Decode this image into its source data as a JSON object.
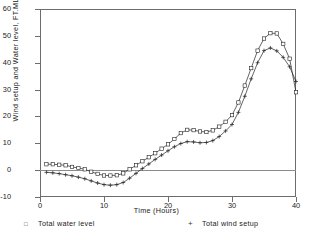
{
  "chart_data": {
    "type": "line",
    "title": "",
    "xlabel": "Time (Hours)",
    "ylabel": "Wind setup and Water level, FT.MLW",
    "xlim": [
      0,
      40
    ],
    "ylim": [
      -10,
      60
    ],
    "xticks": [
      0,
      10,
      20,
      30,
      40
    ],
    "yticks": [
      -10,
      0,
      10,
      20,
      30,
      40,
      50,
      60
    ],
    "grid": false,
    "zero_reference_line": 0,
    "legend_position": "below-axes",
    "x": [
      1,
      2,
      3,
      4,
      5,
      6,
      7,
      8,
      9,
      10,
      11,
      12,
      13,
      14,
      15,
      16,
      17,
      18,
      19,
      20,
      21,
      22,
      23,
      24,
      25,
      26,
      27,
      28,
      29,
      30,
      31,
      32,
      33,
      34,
      35,
      36,
      37,
      38,
      39,
      40
    ],
    "series": [
      {
        "name": "Total water level",
        "marker": "square",
        "color": "#222222",
        "values": [
          2.2,
          2.2,
          2.0,
          1.8,
          1.2,
          0.8,
          0.3,
          -0.6,
          -1.4,
          -2.0,
          -2.0,
          -1.9,
          -1.2,
          0.3,
          1.8,
          3.3,
          4.8,
          6.3,
          8.0,
          9.6,
          11.6,
          13.8,
          15.0,
          14.9,
          14.4,
          14.2,
          14.8,
          16.2,
          18.0,
          20.5,
          25.2,
          31.5,
          38.0,
          44.5,
          49.0,
          51.0,
          50.9,
          47.0,
          41.5,
          29.0
        ]
      },
      {
        "name": "Total wind setup",
        "marker": "plus",
        "color": "#222222",
        "values": [
          -0.8,
          -1.0,
          -1.3,
          -1.7,
          -2.1,
          -2.6,
          -3.2,
          -4.0,
          -4.8,
          -5.4,
          -5.6,
          -5.4,
          -4.6,
          -3.0,
          -1.2,
          0.6,
          2.3,
          4.0,
          5.6,
          7.2,
          8.7,
          9.9,
          10.6,
          10.5,
          10.2,
          10.3,
          11.0,
          12.5,
          14.6,
          17.0,
          21.5,
          27.5,
          34.0,
          40.0,
          44.5,
          45.5,
          44.4,
          42.0,
          38.5,
          33.0
        ]
      }
    ]
  },
  "axes": {
    "ytick_labels": [
      "60",
      "50",
      "40",
      "30",
      "20",
      "10",
      "0",
      "-10"
    ],
    "xtick_labels": [
      "0",
      "10",
      "20",
      "30",
      "40"
    ]
  },
  "legend": {
    "items": [
      {
        "marker": "square-marker",
        "label": "Total water level"
      },
      {
        "marker": "plus-marker",
        "label": "Total wind setup"
      }
    ]
  }
}
